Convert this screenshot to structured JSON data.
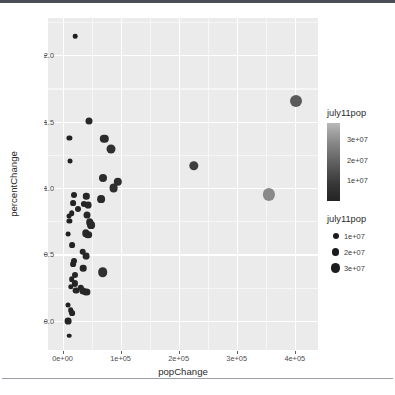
{
  "chart_data": {
    "type": "scatter",
    "title": "",
    "xlabel": "popChange",
    "ylabel": "percentChange",
    "xlim": [
      -25000,
      440000
    ],
    "ylim": [
      -0.22,
      2.28
    ],
    "grid": true,
    "panel_background": "#ebebeb",
    "grid_color": "#ffffff",
    "xticks": [
      {
        "value": 0,
        "label": "0e+00"
      },
      {
        "value": 100000,
        "label": "1e+05"
      },
      {
        "value": 200000,
        "label": "2e+05"
      },
      {
        "value": 300000,
        "label": "3e+05"
      },
      {
        "value": 400000,
        "label": "4e+05"
      }
    ],
    "yticks": [
      {
        "value": 0.0,
        "label": "0.0"
      },
      {
        "value": 0.5,
        "label": "0.5"
      },
      {
        "value": 1.0,
        "label": "1.0"
      },
      {
        "value": 1.5,
        "label": "1.5"
      },
      {
        "value": 2.0,
        "label": "2.0"
      }
    ],
    "legends": [
      {
        "kind": "colourbar",
        "name": "july11pop",
        "title": "july11pop",
        "position": "right",
        "ticks": [
          {
            "value": 30000000,
            "label": "3e+07"
          },
          {
            "value": 20000000,
            "label": "2e+07"
          },
          {
            "value": 10000000,
            "label": "1e+07"
          }
        ],
        "gradient_low_colour": "#232323",
        "gradient_high_colour": "#b9b9b9"
      },
      {
        "kind": "size",
        "name": "july11pop",
        "title": "july11pop",
        "position": "right",
        "entries": [
          {
            "value": 10000000,
            "label": "1e+07",
            "dot_px": 6.0
          },
          {
            "value": 20000000,
            "label": "2e+07",
            "dot_px": 7.6
          },
          {
            "value": 30000000,
            "label": "3e+07",
            "dot_px": 9.4
          }
        ]
      }
    ],
    "points": [
      {
        "x": 22000,
        "y": 2.145,
        "pop": 900000,
        "r": 2.3,
        "colour": "#1f1f1f"
      },
      {
        "x": 402000,
        "y": 1.655,
        "pop": 30000000,
        "r": 6.0,
        "colour": "#5a5a5a"
      },
      {
        "x": 45000,
        "y": 1.502,
        "pop": 4600000,
        "r": 3.5,
        "colour": "#282828"
      },
      {
        "x": 12000,
        "y": 1.378,
        "pop": 1100000,
        "r": 2.6,
        "colour": "#222222"
      },
      {
        "x": 72000,
        "y": 1.372,
        "pop": 9500000,
        "r": 4.2,
        "colour": "#2b2b2b"
      },
      {
        "x": 84000,
        "y": 1.293,
        "pop": 11500000,
        "r": 4.5,
        "colour": "#2f2f2f"
      },
      {
        "x": 226000,
        "y": 1.165,
        "pop": 13500000,
        "r": 4.7,
        "colour": "#3d3d3d"
      },
      {
        "x": 13000,
        "y": 1.201,
        "pop": 1200000,
        "r": 2.5,
        "colour": "#222222"
      },
      {
        "x": 70000,
        "y": 1.073,
        "pop": 8500000,
        "r": 4.0,
        "colour": "#2c2c2c"
      },
      {
        "x": 95000,
        "y": 1.048,
        "pop": 9500000,
        "r": 4.2,
        "colour": "#2d2d2d"
      },
      {
        "x": 88000,
        "y": 1.002,
        "pop": 10500000,
        "r": 4.4,
        "colour": "#2e2e2e"
      },
      {
        "x": 356000,
        "y": 0.952,
        "pop": 38000000,
        "r": 6.1,
        "colour": "#8a8a8a"
      },
      {
        "x": 66000,
        "y": 0.918,
        "pop": 7500000,
        "r": 3.9,
        "colour": "#2a2a2a"
      },
      {
        "x": 20000,
        "y": 0.948,
        "pop": 2500000,
        "r": 3.0,
        "colour": "#242424"
      },
      {
        "x": 41000,
        "y": 0.938,
        "pop": 3300000,
        "r": 3.2,
        "colour": "#262626"
      },
      {
        "x": 18000,
        "y": 0.888,
        "pop": 2200000,
        "r": 2.9,
        "colour": "#242424"
      },
      {
        "x": 37000,
        "y": 0.88,
        "pop": 3000000,
        "r": 3.1,
        "colour": "#252525"
      },
      {
        "x": 44000,
        "y": 0.87,
        "pop": 4000000,
        "r": 3.4,
        "colour": "#272727"
      },
      {
        "x": 26000,
        "y": 0.84,
        "pop": 2600000,
        "r": 3.0,
        "colour": "#252525"
      },
      {
        "x": 16000,
        "y": 0.812,
        "pop": 2000000,
        "r": 2.8,
        "colour": "#232323"
      },
      {
        "x": 43000,
        "y": 0.8,
        "pop": 4400000,
        "r": 3.5,
        "colour": "#272727"
      },
      {
        "x": 11000,
        "y": 0.79,
        "pop": 1200000,
        "r": 2.5,
        "colour": "#222222"
      },
      {
        "x": 12000,
        "y": 0.75,
        "pop": 1500000,
        "r": 2.6,
        "colour": "#222222"
      },
      {
        "x": 47000,
        "y": 0.742,
        "pop": 5600000,
        "r": 3.8,
        "colour": "#282828"
      },
      {
        "x": 49000,
        "y": 0.722,
        "pop": 6200000,
        "r": 3.9,
        "colour": "#292929"
      },
      {
        "x": 10000,
        "y": 0.65,
        "pop": 1000000,
        "r": 2.4,
        "colour": "#212121"
      },
      {
        "x": 40000,
        "y": 0.66,
        "pop": 5200000,
        "r": 3.7,
        "colour": "#282828"
      },
      {
        "x": 44000,
        "y": 0.648,
        "pop": 5600000,
        "r": 3.8,
        "colour": "#282828"
      },
      {
        "x": 17000,
        "y": 0.57,
        "pop": 2200000,
        "r": 2.9,
        "colour": "#242424"
      },
      {
        "x": 35000,
        "y": 0.52,
        "pop": 3600000,
        "r": 3.3,
        "colour": "#262626"
      },
      {
        "x": 40000,
        "y": 0.487,
        "pop": 4200000,
        "r": 3.4,
        "colour": "#272727"
      },
      {
        "x": 20000,
        "y": 0.452,
        "pop": 2500000,
        "r": 3.0,
        "colour": "#242424"
      },
      {
        "x": 18000,
        "y": 0.428,
        "pop": 2300000,
        "r": 2.9,
        "colour": "#242424"
      },
      {
        "x": 36000,
        "y": 0.398,
        "pop": 3800000,
        "r": 3.3,
        "colour": "#262626"
      },
      {
        "x": 69000,
        "y": 0.368,
        "pop": 12500000,
        "r": 4.8,
        "colour": "#303030"
      },
      {
        "x": 21000,
        "y": 0.345,
        "pop": 2600000,
        "r": 3.0,
        "colour": "#252525"
      },
      {
        "x": 16000,
        "y": 0.312,
        "pop": 2100000,
        "r": 2.8,
        "colour": "#232323"
      },
      {
        "x": 22000,
        "y": 0.282,
        "pop": 2800000,
        "r": 3.1,
        "colour": "#252525"
      },
      {
        "x": 31000,
        "y": 0.248,
        "pop": 3400000,
        "r": 3.2,
        "colour": "#262626"
      },
      {
        "x": 23000,
        "y": 0.228,
        "pop": 3800000,
        "r": 3.4,
        "colour": "#262626"
      },
      {
        "x": 35000,
        "y": 0.222,
        "pop": 4200000,
        "r": 3.5,
        "colour": "#272727"
      },
      {
        "x": 41000,
        "y": 0.218,
        "pop": 4600000,
        "r": 3.6,
        "colour": "#272727"
      },
      {
        "x": 14000,
        "y": 0.258,
        "pop": 1800000,
        "r": 2.7,
        "colour": "#232323"
      },
      {
        "x": 10000,
        "y": 0.118,
        "pop": 1200000,
        "r": 2.5,
        "colour": "#222222"
      },
      {
        "x": 14000,
        "y": 0.078,
        "pop": 1900000,
        "r": 2.8,
        "colour": "#232323"
      },
      {
        "x": 17000,
        "y": 0.06,
        "pop": 2300000,
        "r": 2.9,
        "colour": "#242424"
      },
      {
        "x": 9000,
        "y": 0.0,
        "pop": 3000000,
        "r": 3.4,
        "colour": "#252525"
      },
      {
        "x": 12000,
        "y": -0.112,
        "pop": 1000000,
        "r": 2.3,
        "colour": "#212121"
      }
    ],
    "minor_gridlines_x": [
      50000,
      150000,
      250000,
      350000
    ],
    "minor_gridlines_y": [
      0.25,
      0.75,
      1.25,
      1.75,
      2.25
    ]
  }
}
